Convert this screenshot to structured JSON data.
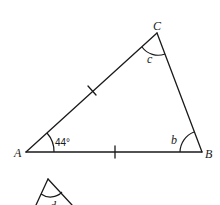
{
  "diagram": {
    "type": "isosceles-triangle",
    "vertices": {
      "A": {
        "label": "A",
        "x": 26,
        "y": 152
      },
      "B": {
        "label": "B",
        "x": 202,
        "y": 152
      },
      "C": {
        "label": "C",
        "x": 157,
        "y": 33
      }
    },
    "angles": {
      "A": {
        "label": "44°"
      },
      "B": {
        "label": "b"
      },
      "C": {
        "label": "c"
      }
    },
    "equal_sides": [
      "AC",
      "AB"
    ],
    "second_figure": {
      "partial_angle_label": "d"
    },
    "colors": {
      "stroke": "#1a1a1a",
      "background": "#ffffff"
    }
  }
}
